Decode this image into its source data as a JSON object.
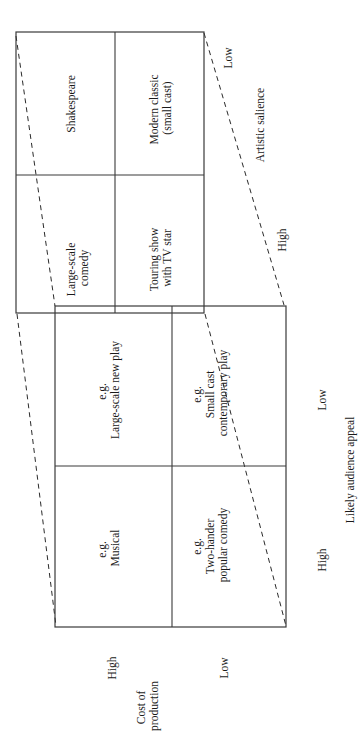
{
  "diagram": {
    "orientation": "rotated 90 degrees counter-clockwise",
    "upper_matrix": {
      "axis_label": "Artistic salience",
      "axis_high": "High",
      "axis_low": "Low",
      "cells": {
        "high_cost_low": [
          "Shakespeare"
        ],
        "low_cost_low": [
          "Modern classic",
          "(small cast)"
        ],
        "high_cost_high": [
          "Large-scale",
          "comedy"
        ],
        "low_cost_high": [
          "Touring show",
          "with TV star"
        ]
      }
    },
    "lower_matrix": {
      "axis_label": "Likely audience appeal",
      "axis_high": "High",
      "axis_low": "Low",
      "cells": {
        "high_cost_low": [
          "e.g.",
          "Large-scale new play"
        ],
        "low_cost_low": [
          "e.g.",
          "Small cast",
          "contemporary play"
        ],
        "high_cost_high": [
          "e.g.",
          "Musical"
        ],
        "low_cost_high": [
          "e.g.",
          "Two-hander",
          "popular comedy"
        ]
      }
    },
    "cost_axis": {
      "label": [
        "Cost of",
        "production"
      ],
      "high": "High",
      "low": "Low"
    }
  }
}
